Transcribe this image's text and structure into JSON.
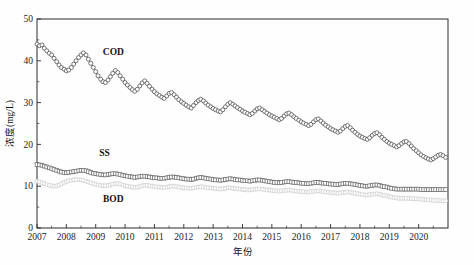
{
  "chart_data": {
    "type": "line",
    "title": "",
    "xlabel": "年份",
    "ylabel": "浓度(mg/L)",
    "xlim": [
      2007.0,
      2021.0
    ],
    "ylim": [
      0,
      50
    ],
    "grid": false,
    "legend_position": "inline-annotations",
    "xticks": [
      "2007",
      "2008",
      "2009",
      "2010",
      "2011",
      "2012",
      "2013",
      "2014",
      "2015",
      "2016",
      "2017",
      "2018",
      "2019",
      "2020"
    ],
    "xtick_values": [
      2007,
      2008,
      2009,
      2010,
      2011,
      2012,
      2013,
      2014,
      2015,
      2016,
      2017,
      2018,
      2019,
      2020
    ],
    "yticks": [
      "0",
      "10",
      "20",
      "30",
      "40",
      "50"
    ],
    "ytick_values": [
      0,
      10,
      20,
      30,
      40,
      50
    ],
    "yminor_values": [
      5,
      15,
      25,
      35,
      45
    ],
    "annotations": [
      {
        "text": "COD",
        "x": 2009.6,
        "y": 41.5
      },
      {
        "text": "SS",
        "x": 2009.3,
        "y": 17.2
      },
      {
        "text": "BOD",
        "x": 2009.6,
        "y": 6.2
      }
    ],
    "x": [
      2007.0,
      2007.08,
      2007.17,
      2007.25,
      2007.33,
      2007.42,
      2007.5,
      2007.58,
      2007.67,
      2007.75,
      2007.83,
      2007.92,
      2008.0,
      2008.08,
      2008.17,
      2008.25,
      2008.33,
      2008.42,
      2008.5,
      2008.58,
      2008.67,
      2008.75,
      2008.83,
      2008.92,
      2009.0,
      2009.08,
      2009.17,
      2009.25,
      2009.33,
      2009.42,
      2009.5,
      2009.58,
      2009.67,
      2009.75,
      2009.83,
      2009.92,
      2010.0,
      2010.08,
      2010.17,
      2010.25,
      2010.33,
      2010.42,
      2010.5,
      2010.58,
      2010.67,
      2010.75,
      2010.83,
      2010.92,
      2011.0,
      2011.08,
      2011.17,
      2011.25,
      2011.33,
      2011.42,
      2011.5,
      2011.58,
      2011.67,
      2011.75,
      2011.83,
      2011.92,
      2012.0,
      2012.08,
      2012.17,
      2012.25,
      2012.33,
      2012.42,
      2012.5,
      2012.58,
      2012.67,
      2012.75,
      2012.83,
      2012.92,
      2013.0,
      2013.08,
      2013.17,
      2013.25,
      2013.33,
      2013.42,
      2013.5,
      2013.58,
      2013.67,
      2013.75,
      2013.83,
      2013.92,
      2014.0,
      2014.08,
      2014.17,
      2014.25,
      2014.33,
      2014.42,
      2014.5,
      2014.58,
      2014.67,
      2014.75,
      2014.83,
      2014.92,
      2015.0,
      2015.08,
      2015.17,
      2015.25,
      2015.33,
      2015.42,
      2015.5,
      2015.58,
      2015.67,
      2015.75,
      2015.83,
      2015.92,
      2016.0,
      2016.08,
      2016.17,
      2016.25,
      2016.33,
      2016.42,
      2016.5,
      2016.58,
      2016.67,
      2016.75,
      2016.83,
      2016.92,
      2017.0,
      2017.08,
      2017.17,
      2017.25,
      2017.33,
      2017.42,
      2017.5,
      2017.58,
      2017.67,
      2017.75,
      2017.83,
      2017.92,
      2018.0,
      2018.08,
      2018.17,
      2018.25,
      2018.33,
      2018.42,
      2018.5,
      2018.58,
      2018.67,
      2018.75,
      2018.83,
      2018.92,
      2019.0,
      2019.08,
      2019.17,
      2019.25,
      2019.33,
      2019.42,
      2019.5,
      2019.58,
      2019.67,
      2019.75,
      2019.83,
      2019.92,
      2020.0,
      2020.08,
      2020.17,
      2020.25,
      2020.33,
      2020.42,
      2020.5,
      2020.58,
      2020.67,
      2020.75,
      2020.83,
      2020.92
    ],
    "series": [
      {
        "name": "COD",
        "marker": "circle",
        "color": "#4a4a4a",
        "fill": "#ffffff",
        "values": [
          44.0,
          43.6,
          43.8,
          43.0,
          42.4,
          41.8,
          41.4,
          40.6,
          39.8,
          39.0,
          38.4,
          38.0,
          37.6,
          37.8,
          38.4,
          39.2,
          40.0,
          40.8,
          41.4,
          41.9,
          41.4,
          40.4,
          39.4,
          38.4,
          37.4,
          36.4,
          35.6,
          35.0,
          34.8,
          35.4,
          36.2,
          37.0,
          37.7,
          37.2,
          36.4,
          35.6,
          34.8,
          34.2,
          33.6,
          33.1,
          32.7,
          33.2,
          34.0,
          34.7,
          35.2,
          34.6,
          33.9,
          33.2,
          32.6,
          32.1,
          31.7,
          31.3,
          31.0,
          31.6,
          32.2,
          32.4,
          31.9,
          31.3,
          30.7,
          30.2,
          29.8,
          29.4,
          29.0,
          28.7,
          29.3,
          30.0,
          30.5,
          30.8,
          30.4,
          29.9,
          29.4,
          29.0,
          28.6,
          28.3,
          28.0,
          27.8,
          28.3,
          29.0,
          29.6,
          30.0,
          29.6,
          29.2,
          28.8,
          28.4,
          28.0,
          27.7,
          27.4,
          27.1,
          27.4,
          28.0,
          28.5,
          28.7,
          28.3,
          27.9,
          27.5,
          27.1,
          26.8,
          26.5,
          26.2,
          25.9,
          26.2,
          26.8,
          27.3,
          27.5,
          27.1,
          26.6,
          26.2,
          25.8,
          25.4,
          25.1,
          24.8,
          24.5,
          24.8,
          25.4,
          25.9,
          26.1,
          25.6,
          25.1,
          24.6,
          24.2,
          23.8,
          23.5,
          23.2,
          22.9,
          23.2,
          23.8,
          24.3,
          24.5,
          24.0,
          23.4,
          22.9,
          22.4,
          22.0,
          21.7,
          21.4,
          21.2,
          21.6,
          22.2,
          22.6,
          22.8,
          22.3,
          21.7,
          21.2,
          20.7,
          20.3,
          20.0,
          19.7,
          19.4,
          19.7,
          20.2,
          20.6,
          20.7,
          20.2,
          19.6,
          19.0,
          18.5,
          18.0,
          17.5,
          17.1,
          16.8,
          16.5,
          16.3,
          16.6,
          17.0,
          17.4,
          17.6,
          17.3,
          16.9
        ]
      },
      {
        "name": "SS",
        "marker": "square",
        "color": "#6b6b6b",
        "fill": "#ffffff",
        "values": [
          15.2,
          15.1,
          15.0,
          14.8,
          14.6,
          14.4,
          14.2,
          14.0,
          13.8,
          13.6,
          13.4,
          13.3,
          13.2,
          13.3,
          13.4,
          13.5,
          13.6,
          13.7,
          13.8,
          13.8,
          13.7,
          13.5,
          13.3,
          13.1,
          13.0,
          12.9,
          12.8,
          12.7,
          12.7,
          12.8,
          12.9,
          13.0,
          13.0,
          12.9,
          12.8,
          12.6,
          12.5,
          12.4,
          12.3,
          12.2,
          12.1,
          12.2,
          12.3,
          12.4,
          12.4,
          12.3,
          12.2,
          12.1,
          12.0,
          12.0,
          11.9,
          11.9,
          11.9,
          12.0,
          12.1,
          12.2,
          12.2,
          12.1,
          12.0,
          11.9,
          11.8,
          11.7,
          11.7,
          11.6,
          11.7,
          11.9,
          12.0,
          12.1,
          12.0,
          11.9,
          11.8,
          11.7,
          11.6,
          11.5,
          11.5,
          11.4,
          11.5,
          11.6,
          11.7,
          11.8,
          11.7,
          11.6,
          11.5,
          11.5,
          11.4,
          11.3,
          11.3,
          11.2,
          11.3,
          11.4,
          11.5,
          11.5,
          11.4,
          11.3,
          11.2,
          11.1,
          11.0,
          10.9,
          10.9,
          10.8,
          10.9,
          11.0,
          11.1,
          11.1,
          11.0,
          10.9,
          10.9,
          10.8,
          10.7,
          10.7,
          10.6,
          10.6,
          10.7,
          10.8,
          10.9,
          10.9,
          10.8,
          10.7,
          10.7,
          10.6,
          10.5,
          10.5,
          10.4,
          10.4,
          10.5,
          10.6,
          10.7,
          10.7,
          10.6,
          10.5,
          10.4,
          10.3,
          10.2,
          10.1,
          10.0,
          10.0,
          10.1,
          10.2,
          10.3,
          10.3,
          10.2,
          10.0,
          9.9,
          9.8,
          9.6,
          9.5,
          9.4,
          9.3,
          9.3,
          9.3,
          9.3,
          9.3,
          9.3,
          9.3,
          9.3,
          9.3,
          9.3,
          9.2,
          9.2,
          9.2,
          9.2,
          9.2,
          9.2,
          9.2,
          9.2,
          9.2,
          9.2,
          9.2
        ]
      },
      {
        "name": "BOD",
        "marker": "circle",
        "color": "#c9c9c9",
        "fill": "#ffffff",
        "values": [
          11.2,
          11.0,
          10.8,
          10.6,
          10.4,
          10.2,
          10.1,
          10.0,
          10.1,
          10.3,
          10.6,
          10.9,
          11.1,
          11.3,
          11.4,
          11.5,
          11.6,
          11.6,
          11.5,
          11.4,
          11.2,
          11.0,
          10.8,
          10.6,
          10.4,
          10.3,
          10.2,
          10.1,
          10.1,
          10.2,
          10.3,
          10.5,
          10.6,
          10.6,
          10.5,
          10.3,
          10.1,
          10.0,
          9.9,
          9.8,
          9.7,
          9.8,
          9.9,
          10.1,
          10.2,
          10.2,
          10.1,
          10.0,
          9.9,
          9.8,
          9.8,
          9.7,
          9.7,
          9.8,
          9.9,
          10.0,
          10.0,
          9.9,
          9.8,
          9.7,
          9.6,
          9.6,
          9.5,
          9.5,
          9.6,
          9.7,
          9.8,
          9.9,
          9.8,
          9.7,
          9.6,
          9.6,
          9.5,
          9.4,
          9.4,
          9.3,
          9.4,
          9.5,
          9.6,
          9.6,
          9.5,
          9.4,
          9.4,
          9.3,
          9.2,
          9.2,
          9.1,
          9.1,
          9.2,
          9.3,
          9.3,
          9.4,
          9.3,
          9.2,
          9.1,
          9.1,
          9.0,
          8.9,
          8.9,
          8.8,
          8.9,
          9.0,
          9.0,
          9.1,
          9.0,
          8.9,
          8.8,
          8.8,
          8.7,
          8.7,
          8.6,
          8.6,
          8.7,
          8.8,
          8.8,
          8.9,
          8.8,
          8.7,
          8.6,
          8.6,
          8.5,
          8.4,
          8.4,
          8.3,
          8.4,
          8.5,
          8.5,
          8.6,
          8.5,
          8.4,
          8.3,
          8.2,
          8.1,
          8.0,
          7.9,
          7.9,
          8.0,
          8.1,
          8.1,
          8.2,
          8.1,
          7.9,
          7.8,
          7.7,
          7.5,
          7.4,
          7.3,
          7.2,
          7.1,
          7.1,
          7.1,
          7.1,
          7.1,
          7.0,
          7.0,
          7.0,
          6.9,
          6.9,
          6.8,
          6.8,
          6.7,
          6.7,
          6.6,
          6.6,
          6.6,
          6.5,
          6.5,
          6.5
        ]
      }
    ]
  }
}
